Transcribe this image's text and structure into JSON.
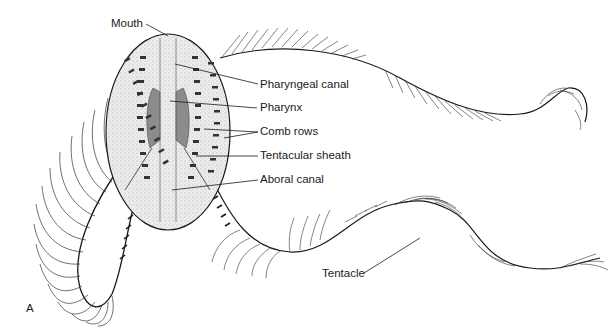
{
  "figure": {
    "panel_label": "A",
    "labels": [
      {
        "id": "mouth",
        "text": "Mouth"
      },
      {
        "id": "pharyngeal_canal",
        "text": "Pharyngeal canal"
      },
      {
        "id": "pharynx",
        "text": "Pharynx"
      },
      {
        "id": "comb_rows",
        "text": "Comb rows"
      },
      {
        "id": "tentacular_sheath",
        "text": "Tentacular sheath"
      },
      {
        "id": "aboral_canal",
        "text": "Aboral canal"
      },
      {
        "id": "tentacle",
        "text": "Tentacle"
      }
    ],
    "colors": {
      "ink": "#1a1a1a",
      "body_fill": "#e6e6e6",
      "pharynx_fill": "#8c8c8c",
      "background": "#ffffff"
    }
  }
}
